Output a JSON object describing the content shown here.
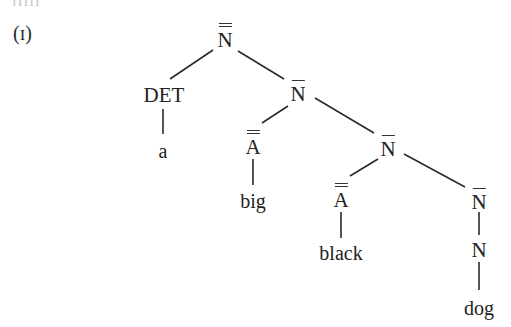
{
  "cut_text": "ɪɪɪɪɪ",
  "example_label": "(ɪ)",
  "tree": {
    "root": {
      "cat": "N",
      "bars": 2
    },
    "det": {
      "cat": "DET",
      "word": "a"
    },
    "nbar1": {
      "cat": "N",
      "bars": 1
    },
    "adj1": {
      "cat": "A",
      "bars": 2,
      "word": "big"
    },
    "nbar2": {
      "cat": "N",
      "bars": 1
    },
    "adj2": {
      "cat": "A",
      "bars": 2,
      "word": "black"
    },
    "nbar3": {
      "cat": "N",
      "bars": 1
    },
    "noun": {
      "cat": "N",
      "bars": 0,
      "word": "dog"
    }
  },
  "colors": {
    "ink": "#222222",
    "background": "#ffffff"
  }
}
